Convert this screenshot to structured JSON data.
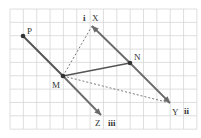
{
  "diagram": {
    "grid": {
      "x0": 10,
      "y0": 9,
      "cell": 13.35,
      "cols": 14,
      "rows": 9,
      "color": "#d6d6d6"
    },
    "colors": {
      "line": "#555555",
      "arrow": "#6a6a6a",
      "dashed": "#6a6a6a",
      "point": "#333333",
      "label": "#333333"
    },
    "points": {
      "P": {
        "x": 23,
        "y": 36,
        "label": "P",
        "lx": 27,
        "ly": 34
      },
      "M": {
        "x": 63,
        "y": 76,
        "label": "M",
        "lx": 52,
        "ly": 88
      },
      "N": {
        "x": 130,
        "y": 63,
        "label": "N",
        "lx": 134,
        "ly": 60
      },
      "X": {
        "x": 92,
        "y": 26,
        "label": "X",
        "lx": 92,
        "ly": 21
      },
      "Y": {
        "x": 170,
        "y": 103,
        "label": "Y",
        "lx": 172,
        "ly": 115
      },
      "Z": {
        "x": 101,
        "y": 115,
        "label": "Z",
        "lx": 95,
        "ly": 126
      }
    },
    "roman_labels": {
      "i": {
        "text": "i",
        "x": 83,
        "y": 21
      },
      "ii": {
        "text": "ii",
        "x": 184,
        "y": 114
      },
      "iii": {
        "text": "iii",
        "x": 108,
        "y": 126
      }
    }
  }
}
